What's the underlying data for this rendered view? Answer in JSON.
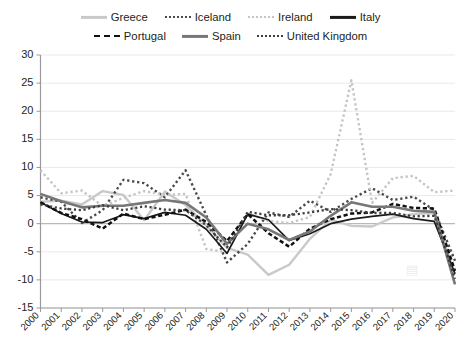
{
  "chart_data": {
    "type": "line",
    "title": "",
    "xlabel": "",
    "ylabel": "",
    "x": [
      2000,
      2001,
      2002,
      2003,
      2004,
      2005,
      2006,
      2007,
      2008,
      2009,
      2010,
      2011,
      2012,
      2013,
      2014,
      2015,
      2016,
      2017,
      2018,
      2019,
      2020
    ],
    "xticklabels": [
      "2000",
      "2001",
      "2002",
      "2003",
      "2004",
      "2005",
      "2006",
      "2007",
      "2008",
      "2009",
      "2010",
      "2011",
      "2012",
      "2013",
      "2014",
      "2015",
      "2016",
      "2017",
      "2018",
      "2019",
      "2020"
    ],
    "yticklabels": [
      "30",
      "25",
      "20",
      "15",
      "10",
      "5",
      "0",
      "-5",
      "-10",
      "-15"
    ],
    "yticks": [
      30,
      25,
      20,
      15,
      10,
      5,
      0,
      -5,
      -10,
      -15
    ],
    "ylim": [
      -15,
      30
    ],
    "xlim": [
      2000,
      2020
    ],
    "grid": true,
    "legend_position": "top",
    "series": [
      {
        "name": "Greece",
        "style": "solid",
        "color": "#c9c9c9",
        "width": 2.4,
        "values": [
          3.9,
          4.1,
          3.4,
          5.8,
          5.1,
          0.6,
          5.7,
          3.3,
          -0.3,
          -4.3,
          -5.5,
          -9.1,
          -7.3,
          -2.7,
          0.7,
          -0.4,
          -0.5,
          1.1,
          1.7,
          1.9,
          -9.0
        ]
      },
      {
        "name": "Iceland",
        "style": "dotted",
        "color": "#4a4a4c",
        "width": 2.4,
        "values": [
          4.7,
          3.9,
          0.1,
          2.4,
          7.8,
          7.2,
          4.7,
          9.5,
          1.5,
          -6.9,
          -3.6,
          2.0,
          1.2,
          4.1,
          2.1,
          4.4,
          6.3,
          4.2,
          4.8,
          2.4,
          -6.6
        ]
      },
      {
        "name": "Ireland",
        "style": "dotted",
        "color": "#c4c4c4",
        "width": 2.4,
        "values": [
          9.5,
          5.4,
          5.9,
          3.1,
          4.6,
          5.8,
          5.1,
          5.3,
          -4.5,
          -5.1,
          1.8,
          0.5,
          0.1,
          1.2,
          8.8,
          25.5,
          3.7,
          8.1,
          8.5,
          5.6,
          5.9
        ]
      },
      {
        "name": "Italy",
        "style": "solid",
        "color": "#1a1a1a",
        "width": 1.7,
        "values": [
          3.8,
          1.8,
          0.3,
          0.2,
          1.6,
          0.9,
          2.0,
          1.5,
          -1.0,
          -5.3,
          1.7,
          0.7,
          -3.0,
          -1.8,
          0.0,
          0.8,
          1.3,
          1.7,
          0.9,
          0.4,
          -8.9
        ]
      },
      {
        "name": "Portugal",
        "style": "dashed",
        "color": "#111111",
        "width": 2.5,
        "values": [
          3.8,
          1.9,
          0.8,
          -0.9,
          1.8,
          0.8,
          1.6,
          2.5,
          0.3,
          -3.1,
          1.7,
          -1.7,
          -4.1,
          -0.9,
          0.8,
          1.8,
          2.0,
          3.5,
          2.8,
          2.7,
          -8.4
        ]
      },
      {
        "name": "Spain",
        "style": "solid",
        "color": "#777779",
        "width": 2.6,
        "values": [
          5.3,
          4.0,
          2.9,
          3.2,
          3.2,
          3.7,
          4.2,
          3.7,
          1.1,
          -3.6,
          0.0,
          -1.0,
          -2.9,
          -1.4,
          1.4,
          3.8,
          3.0,
          3.0,
          2.3,
          2.1,
          -10.8
        ]
      },
      {
        "name": "United Kingdom",
        "style": "dotted",
        "color": "#3d3d3f",
        "width": 2.3,
        "values": [
          3.4,
          2.7,
          2.4,
          3.3,
          2.4,
          3.1,
          2.5,
          2.4,
          -0.3,
          -4.2,
          2.1,
          1.5,
          1.5,
          2.0,
          2.6,
          2.4,
          1.9,
          1.9,
          1.3,
          1.4,
          -9.8
        ]
      }
    ]
  },
  "legend": {
    "row1": [
      {
        "label": "Greece",
        "style": "solid",
        "color": "#c9c9c9"
      },
      {
        "label": "Iceland",
        "style": "dotted",
        "color": "#4a4a4c"
      },
      {
        "label": "Ireland",
        "style": "dotted",
        "color": "#c4c4c4"
      },
      {
        "label": "Italy",
        "style": "solid",
        "color": "#1a1a1a"
      }
    ],
    "row2": [
      {
        "label": "Portugal",
        "style": "dashed",
        "color": "#111111"
      },
      {
        "label": "Spain",
        "style": "solid",
        "color": "#777779"
      },
      {
        "label": "United Kingdom",
        "style": "dotted",
        "color": "#3d3d3f"
      }
    ]
  }
}
